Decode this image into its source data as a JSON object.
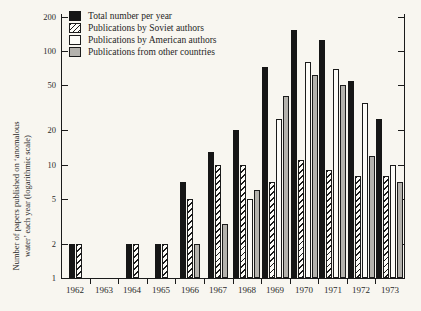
{
  "y_axis": {
    "label_line1": "Number of papers published on ‘anomalous",
    "label_line2": "water’ each year (logarithmic scale)"
  },
  "chart_data": {
    "type": "bar",
    "scale_y": "log10",
    "ylim": [
      1,
      200
    ],
    "y_ticks": [
      200,
      100,
      50,
      20,
      10,
      5,
      2,
      1
    ],
    "grid": false,
    "legend_position": "top-left-inside",
    "title": "",
    "xlabel": "",
    "ylabel": "Number of papers published on ‘anomalous water’ each year (logarithmic scale)",
    "categories": [
      "1962",
      "1963",
      "1964",
      "1965",
      "1966",
      "1967",
      "1968",
      "1969",
      "1970",
      "1971",
      "1972",
      "1973"
    ],
    "series": [
      {
        "name": "Total number per year",
        "key": "total",
        "style": "solid",
        "color": "#161616",
        "values": [
          2,
          0,
          2,
          2,
          7,
          13,
          20,
          72,
          155,
          125,
          55,
          25
        ]
      },
      {
        "name": "Publications by Soviet authors",
        "key": "soviet",
        "style": "hatch",
        "color": "hatched-black-on-white",
        "values": [
          2,
          0,
          2,
          2,
          5,
          10,
          10,
          7,
          11,
          9,
          8,
          8
        ]
      },
      {
        "name": "Publications by American authors",
        "key": "american",
        "style": "white",
        "color": "#fdfcf8",
        "values": [
          0,
          0,
          0,
          0,
          0,
          0,
          5,
          25,
          80,
          70,
          35,
          10
        ]
      },
      {
        "name": "Publications from other countries",
        "key": "other",
        "style": "gray",
        "color": "#b4b2ad",
        "values": [
          0,
          0,
          0,
          0,
          2,
          3,
          6,
          40,
          62,
          50,
          12,
          7
        ]
      }
    ]
  }
}
